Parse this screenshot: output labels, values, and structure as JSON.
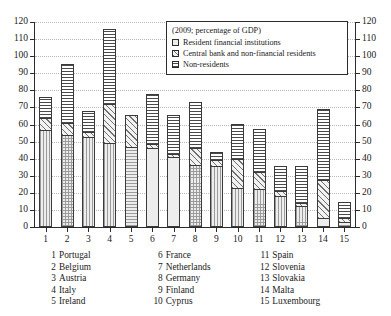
{
  "chart_data": {
    "type": "bar",
    "subtype": "stacked-bar",
    "title": "",
    "legend_title": "(2009; percentage of GDP)",
    "legend_position": "top-right-inside",
    "xlabel": "",
    "ylabel": "",
    "ylim": [
      0,
      120
    ],
    "ytick_step": 10,
    "grid": true,
    "dual_y_axis": true,
    "yticks": [
      0,
      10,
      20,
      30,
      40,
      50,
      60,
      70,
      80,
      90,
      100,
      110,
      120
    ],
    "categories": [
      "1",
      "2",
      "3",
      "4",
      "5",
      "6",
      "7",
      "8",
      "9",
      "10",
      "11",
      "12",
      "13",
      "14",
      "15"
    ],
    "category_names": [
      "Portugal",
      "Belgium",
      "Austria",
      "Italy",
      "Ireland",
      "France",
      "Netherlands",
      "Germany",
      "Finland",
      "Cyprus",
      "Spain",
      "Slovenia",
      "Slovakia",
      "Malta",
      "Luxembourg"
    ],
    "series": [
      {
        "name": "Resident financial institutions",
        "pattern": "fine-dotted-grid",
        "values": [
          56.5,
          54.0,
          52.5,
          49.0,
          47.0,
          46.0,
          41.0,
          36.5,
          36.0,
          23.0,
          22.5,
          18.0,
          12.5,
          5.0,
          3.0
        ]
      },
      {
        "name": "Central bank and non-financial residents",
        "pattern": "diagonal-hatch",
        "values": [
          7.5,
          7.0,
          3.0,
          23.0,
          18.5,
          2.5,
          2.0,
          10.0,
          3.0,
          17.0,
          9.5,
          3.0,
          1.5,
          22.5,
          2.0
        ]
      },
      {
        "name": "Non-residents",
        "pattern": "horizontal-lines",
        "values": [
          12.0,
          34.5,
          12.5,
          44.0,
          0.0,
          29.5,
          22.5,
          26.5,
          5.0,
          20.5,
          25.5,
          14.5,
          21.5,
          41.5,
          9.5
        ]
      }
    ],
    "totals": [
      76.0,
      95.5,
      68.0,
      116.0,
      65.5,
      78.0,
      65.5,
      73.0,
      44.0,
      60.5,
      57.5,
      35.5,
      35.5,
      69.0,
      14.5
    ]
  },
  "legend": {
    "title": "(2009; percentage of GDP)",
    "entries": [
      {
        "label": "Resident financial institutions"
      },
      {
        "label": "Central bank and non-financial residents"
      },
      {
        "label": "Non-residents"
      }
    ]
  },
  "country_key": {
    "columns": [
      [
        {
          "num": "1",
          "name": "Portugal"
        },
        {
          "num": "2",
          "name": "Belgium"
        },
        {
          "num": "3",
          "name": "Austria"
        },
        {
          "num": "4",
          "name": "Italy"
        },
        {
          "num": "5",
          "name": "Ireland"
        }
      ],
      [
        {
          "num": "6",
          "name": "France"
        },
        {
          "num": "7",
          "name": "Netherlands"
        },
        {
          "num": "8",
          "name": "Germany"
        },
        {
          "num": "9",
          "name": "Finland"
        },
        {
          "num": "10",
          "name": "Cyprus"
        }
      ],
      [
        {
          "num": "11",
          "name": "Spain"
        },
        {
          "num": "12",
          "name": "Slovenia"
        },
        {
          "num": "13",
          "name": "Slovakia"
        },
        {
          "num": "14",
          "name": "Malta"
        },
        {
          "num": "15",
          "name": "Luxembourg"
        }
      ]
    ]
  },
  "colors": {
    "axis": "#2b2b2b",
    "grid": "#b9b9b9",
    "bar_outline": "#3a3a3a",
    "background": "#ffffff",
    "text": "#1a1a1a"
  }
}
